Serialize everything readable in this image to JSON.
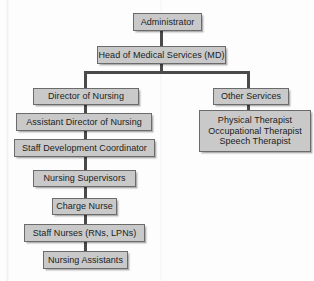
{
  "diagram": {
    "type": "org-chart",
    "colors": {
      "node_fill": "#c9c9c9",
      "node_border": "#6b6b6b",
      "connector": "#4a4a4a",
      "text": "#1c1c1c",
      "background": "#fdfdfd"
    },
    "nodes": {
      "administrator": {
        "label": "Administrator"
      },
      "head_medical": {
        "label": "Head of Medical Services (MD)"
      },
      "director_nursing": {
        "label": "Director of Nursing"
      },
      "other_services": {
        "label": "Other Services"
      },
      "assistant_director": {
        "label": "Assistant Director of Nursing"
      },
      "therapists": {
        "line1": "Physical Therapist",
        "line2": "Occupational Therapist",
        "line3": "Speech Therapist"
      },
      "staff_development": {
        "label": "Staff Development Coordinator"
      },
      "nursing_supervisors": {
        "label": "Nursing Supervisors"
      },
      "charge_nurse": {
        "label": "Charge Nurse"
      },
      "staff_nurses": {
        "label": "Staff Nurses (RNs, LPNs)"
      },
      "nursing_assistants": {
        "label": "Nursing Assistants"
      }
    }
  }
}
